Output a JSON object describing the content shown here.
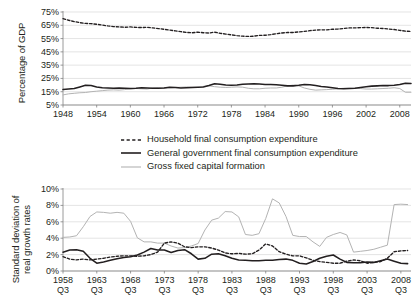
{
  "legend": {
    "items": [
      {
        "label": "Household final consumption expenditure",
        "style": "dashed",
        "color": "#231f20"
      },
      {
        "label": "General government final consumption expenditure",
        "style": "solid",
        "color": "#231f20"
      },
      {
        "label": "Gross fixed capital formation",
        "style": "solid",
        "color": "#b3b3b3"
      }
    ]
  },
  "chart_data": [
    {
      "type": "line",
      "id": "share-of-gdp",
      "title": "",
      "xlabel": "",
      "ylabel": "Percentage of GDP",
      "ylim": [
        5,
        75
      ],
      "yticks": [
        5,
        15,
        25,
        35,
        45,
        55,
        65,
        75
      ],
      "ytick_labels": [
        "5%",
        "15%",
        "25%",
        "35%",
        "45%",
        "55%",
        "65%",
        "75%"
      ],
      "xlim": [
        1948,
        2010
      ],
      "xticks": [
        1948,
        1954,
        1960,
        1966,
        1972,
        1978,
        1984,
        1990,
        1996,
        2002,
        2008
      ],
      "xtick_labels": [
        "1948",
        "1954",
        "1960",
        "1966",
        "1972",
        "1978",
        "1984",
        "1990",
        "1996",
        "2002",
        "2008"
      ],
      "grid": true,
      "legend_position": "below",
      "x": [
        1948,
        1949,
        1950,
        1951,
        1952,
        1953,
        1954,
        1955,
        1956,
        1957,
        1958,
        1959,
        1960,
        1961,
        1962,
        1963,
        1964,
        1965,
        1966,
        1967,
        1968,
        1969,
        1970,
        1971,
        1972,
        1973,
        1974,
        1975,
        1976,
        1977,
        1978,
        1979,
        1980,
        1981,
        1982,
        1983,
        1984,
        1985,
        1986,
        1987,
        1988,
        1989,
        1990,
        1991,
        1992,
        1993,
        1994,
        1995,
        1996,
        1997,
        1998,
        1999,
        2000,
        2001,
        2002,
        2003,
        2004,
        2005,
        2006,
        2007,
        2008,
        2009,
        2010
      ],
      "series": [
        {
          "name": "Household final consumption expenditure",
          "style": "dashed",
          "color": "#231f20",
          "values": [
            70.0,
            68.8,
            67.8,
            67.0,
            66.4,
            66.2,
            65.8,
            65.2,
            64.5,
            64.0,
            63.8,
            63.5,
            63.8,
            63.4,
            63.3,
            63.5,
            63.0,
            62.5,
            62.0,
            61.4,
            60.8,
            60.2,
            59.6,
            59.4,
            59.8,
            59.4,
            59.2,
            59.8,
            59.0,
            58.4,
            57.8,
            57.2,
            56.8,
            56.6,
            56.8,
            57.4,
            57.5,
            58.0,
            58.6,
            59.2,
            59.6,
            59.6,
            60.0,
            60.4,
            61.0,
            61.4,
            61.6,
            61.6,
            62.0,
            62.2,
            62.6,
            63.0,
            63.0,
            63.2,
            63.4,
            63.2,
            62.8,
            62.6,
            62.2,
            61.8,
            61.2,
            60.6,
            60.4
          ]
        },
        {
          "name": "General government final consumption expenditure",
          "style": "solid",
          "color": "#231f20",
          "values": [
            16.6,
            17.0,
            17.4,
            18.6,
            19.8,
            19.6,
            18.6,
            18.0,
            17.8,
            17.6,
            17.8,
            17.6,
            17.4,
            17.6,
            18.0,
            17.8,
            17.6,
            17.6,
            17.8,
            18.4,
            18.2,
            17.8,
            18.0,
            18.2,
            18.4,
            18.6,
            19.6,
            21.0,
            20.6,
            20.0,
            19.8,
            20.0,
            20.6,
            20.8,
            21.0,
            20.8,
            20.4,
            20.4,
            20.2,
            19.8,
            19.4,
            19.4,
            19.8,
            20.4,
            20.2,
            19.6,
            19.0,
            18.6,
            18.0,
            17.4,
            17.2,
            17.4,
            17.6,
            18.2,
            18.8,
            19.2,
            19.4,
            19.6,
            19.6,
            19.8,
            20.4,
            21.4,
            21.2
          ]
        },
        {
          "name": "Gross fixed capital formation",
          "style": "solid",
          "color": "#b3b3b3",
          "values": [
            12.6,
            13.4,
            13.8,
            14.2,
            14.4,
            15.0,
            15.4,
            15.8,
            16.2,
            16.4,
            16.2,
            16.6,
            17.2,
            17.4,
            17.2,
            17.0,
            17.8,
            18.0,
            17.8,
            18.0,
            18.2,
            18.4,
            18.6,
            18.4,
            18.2,
            19.0,
            19.4,
            18.8,
            18.4,
            18.2,
            18.4,
            18.6,
            18.4,
            17.6,
            17.2,
            17.2,
            17.6,
            17.8,
            17.8,
            18.4,
            19.4,
            20.0,
            19.4,
            17.8,
            16.8,
            16.2,
            16.4,
            16.6,
            16.8,
            17.2,
            17.6,
            17.6,
            17.6,
            17.4,
            17.0,
            17.0,
            17.2,
            17.4,
            17.6,
            18.0,
            17.4,
            14.6,
            14.6
          ]
        }
      ]
    },
    {
      "type": "line",
      "id": "volatility",
      "title": "",
      "xlabel": "",
      "ylabel": "Standard deviation of real growth rates",
      "ylim": [
        0,
        10
      ],
      "yticks": [
        0,
        2,
        4,
        6,
        8,
        10
      ],
      "ytick_labels": [
        "0%",
        "2%",
        "4%",
        "6%",
        "8%",
        "10%"
      ],
      "xlim": [
        1958,
        2009.5
      ],
      "xticks": [
        1958,
        1963,
        1968,
        1973,
        1978,
        1983,
        1988,
        1993,
        1998,
        2003,
        2008
      ],
      "xtick_labels": [
        "1958",
        "1963",
        "1968",
        "1973",
        "1978",
        "1983",
        "1988",
        "1993",
        "1998",
        "2003",
        "2008"
      ],
      "xtick_sublabel": "Q3",
      "grid": true,
      "legend_position": "above",
      "x": [
        1958,
        1959,
        1960,
        1961,
        1962,
        1963,
        1964,
        1965,
        1966,
        1967,
        1968,
        1969,
        1970,
        1971,
        1972,
        1973,
        1974,
        1975,
        1976,
        1977,
        1978,
        1979,
        1980,
        1981,
        1982,
        1983,
        1984,
        1985,
        1986,
        1987,
        1988,
        1989,
        1990,
        1991,
        1992,
        1993,
        1994,
        1995,
        1996,
        1997,
        1998,
        1999,
        2000,
        2001,
        2002,
        2003,
        2004,
        2005,
        2006,
        2007,
        2008,
        2009
      ],
      "series": [
        {
          "name": "Household final consumption expenditure",
          "style": "dashed",
          "color": "#231f20",
          "values": [
            1.75,
            1.45,
            1.35,
            1.45,
            1.35,
            1.45,
            1.55,
            1.7,
            1.8,
            1.85,
            1.85,
            1.8,
            1.85,
            2.0,
            2.3,
            3.4,
            3.55,
            3.4,
            2.95,
            2.85,
            2.95,
            2.95,
            2.8,
            2.55,
            2.2,
            2.1,
            2.15,
            2.05,
            2.1,
            2.55,
            3.3,
            3.05,
            2.35,
            2.05,
            1.85,
            1.85,
            1.6,
            1.3,
            1.15,
            1.05,
            0.95,
            0.95,
            1.2,
            1.35,
            1.25,
            0.95,
            1.05,
            1.15,
            1.55,
            2.35,
            2.45,
            2.5
          ]
        },
        {
          "name": "General government final consumption expenditure",
          "style": "solid",
          "color": "#231f20",
          "values": [
            2.3,
            2.55,
            2.6,
            2.4,
            1.55,
            0.95,
            1.1,
            1.3,
            1.5,
            1.65,
            1.75,
            1.95,
            2.3,
            2.75,
            2.55,
            2.55,
            2.25,
            2.5,
            2.6,
            2.1,
            1.45,
            1.55,
            2.05,
            2.1,
            1.85,
            1.55,
            1.35,
            1.3,
            1.25,
            1.25,
            1.3,
            1.3,
            1.4,
            1.45,
            1.3,
            0.95,
            0.85,
            1.15,
            1.55,
            1.8,
            1.95,
            1.45,
            1.05,
            1.0,
            1.0,
            1.1,
            1.05,
            1.25,
            1.45,
            1.2,
            0.95,
            0.9
          ]
        },
        {
          "name": "Gross fixed capital formation",
          "style": "solid",
          "color": "#b3b3b3",
          "values": [
            4.1,
            4.15,
            4.3,
            5.4,
            6.65,
            7.2,
            7.15,
            7.05,
            7.15,
            7.05,
            6.05,
            4.05,
            3.55,
            3.55,
            3.4,
            3.4,
            3.05,
            2.8,
            2.85,
            3.05,
            3.35,
            5.0,
            6.2,
            6.45,
            7.25,
            7.2,
            6.6,
            4.45,
            4.35,
            4.55,
            6.4,
            8.8,
            8.3,
            6.65,
            4.35,
            4.2,
            4.2,
            3.55,
            3.0,
            4.1,
            4.45,
            4.7,
            4.4,
            2.3,
            2.4,
            2.5,
            2.65,
            2.9,
            3.15,
            8.1,
            8.15,
            8.1
          ]
        }
      ]
    }
  ]
}
